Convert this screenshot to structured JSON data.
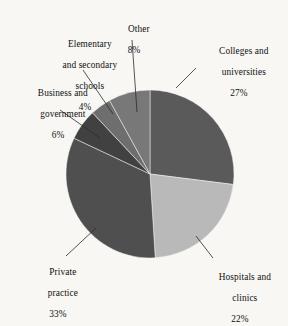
{
  "figure": {
    "background_color": "#f8f7f3",
    "text_color": "#101010",
    "leader_line_color": "#2b2b2b"
  },
  "chart_data": {
    "type": "pie",
    "title": "",
    "subtitle": "",
    "xlabel": "",
    "ylabel": "",
    "legend_position": "none",
    "grid": false,
    "start_angle_deg": 0,
    "direction": "clockwise",
    "units": "percent",
    "center": {
      "x": 150,
      "y": 174
    },
    "radius": 84,
    "categories": [
      "Colleges and universities",
      "Hospitals and clinics",
      "Private practice",
      "Business and government",
      "Elementary and secondary schools",
      "Other"
    ],
    "values": [
      27,
      22,
      33,
      6,
      4,
      8
    ],
    "labels": [
      "27%",
      "22%",
      "33%",
      "6%",
      "4%",
      "8%"
    ],
    "colors": [
      "#5a5a5a",
      "#b9b9b9",
      "#4f4f4f",
      "#414141",
      "#6e6e6e",
      "#787878"
    ],
    "slices": [
      {
        "name": "Colleges and universities",
        "value": 27,
        "label": "27%",
        "color": "#5a5a5a",
        "start_deg": 0,
        "end_deg": 97.2
      },
      {
        "name": "Hospitals and clinics",
        "value": 22,
        "label": "22%",
        "color": "#b9b9b9",
        "start_deg": 97.2,
        "end_deg": 176.4
      },
      {
        "name": "Private practice",
        "value": 33,
        "label": "33%",
        "color": "#4f4f4f",
        "start_deg": 176.4,
        "end_deg": 295.2
      },
      {
        "name": "Business and government",
        "value": 6,
        "label": "6%",
        "color": "#414141",
        "start_deg": 295.2,
        "end_deg": 316.8
      },
      {
        "name": "Elementary and secondary schools",
        "value": 4,
        "label": "4%",
        "color": "#6e6e6e",
        "start_deg": 316.8,
        "end_deg": 331.2
      },
      {
        "name": "Other",
        "value": 8,
        "label": "8%",
        "color": "#787878",
        "start_deg": 331.2,
        "end_deg": 360
      }
    ]
  },
  "callouts": {
    "colleges": {
      "line1": "Colleges and",
      "line2": "universities",
      "percent": "27%"
    },
    "hospitals": {
      "line1": "Hospitals and",
      "line2": "clinics",
      "percent": "22%"
    },
    "private": {
      "line1": "Private",
      "line2": "practice",
      "percent": "33%"
    },
    "business": {
      "line1": "Business and",
      "line2": "government",
      "percent": "6%"
    },
    "elementary": {
      "line1": "Elementary",
      "line2": "and secondary",
      "line3": "schools",
      "percent": "4%"
    },
    "other": {
      "line1": "Other",
      "percent": "8%"
    }
  }
}
